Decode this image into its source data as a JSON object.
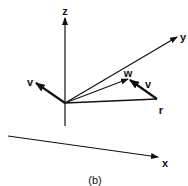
{
  "diagram": {
    "caption": "(b)",
    "colors": {
      "stroke": "#111111",
      "background": "#ffffff"
    },
    "origin": {
      "x": 65,
      "y": 103
    },
    "axes": [
      {
        "name": "z",
        "label": "z",
        "from": [
          65,
          126
        ],
        "to": [
          65,
          18
        ],
        "label_pos": [
          65,
          11
        ]
      },
      {
        "name": "y",
        "label": "y",
        "from": [
          65,
          103
        ],
        "to": [
          177,
          37
        ],
        "label_pos": [
          183,
          37
        ]
      },
      {
        "name": "x",
        "label": "x",
        "from": [
          8,
          136
        ],
        "to": [
          158,
          157
        ],
        "label_pos": [
          165,
          163
        ]
      }
    ],
    "vectors": [
      {
        "name": "v-origin",
        "label": "v",
        "from": [
          65,
          103
        ],
        "to": [
          36,
          83
        ],
        "label_pos": [
          30,
          82
        ]
      },
      {
        "name": "r",
        "label": "r",
        "from": [
          65,
          103
        ],
        "to": [
          157,
          99
        ],
        "label_pos": [
          161,
          110
        ]
      },
      {
        "name": "w",
        "label": "w",
        "from": [
          65,
          103
        ],
        "to": [
          128,
          79
        ],
        "label_pos": [
          128,
          73
        ]
      },
      {
        "name": "v-at-r",
        "label": "v",
        "from": [
          157,
          99
        ],
        "to": [
          130,
          80
        ],
        "label_pos": [
          148,
          84
        ]
      }
    ],
    "caption_pos": [
      95,
      180
    ]
  }
}
